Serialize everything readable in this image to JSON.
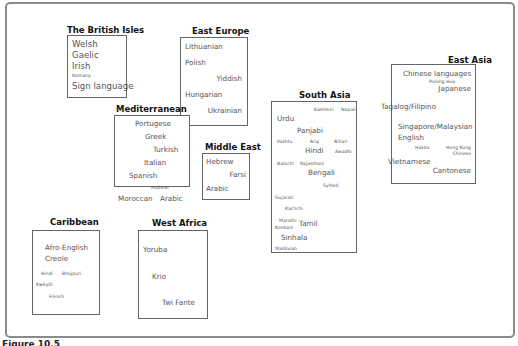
{
  "figure": {
    "caption_label": "Figure 10.5",
    "caption_text": "Community languages in ..."
  },
  "groups": {
    "british_isles": {
      "title": "The British Isles",
      "languages": [
        "Welsh",
        "Gaelic",
        "Irish",
        "Romany",
        "Sign language"
      ]
    },
    "east_europe": {
      "title": "East Europe",
      "languages": [
        "Lithuanian",
        "Polish",
        "Yiddish",
        "Hungarian",
        "Ukrainian"
      ]
    },
    "mediterranean": {
      "title": "Mediterranean",
      "languages": [
        "Portugese",
        "Greek",
        "Turkish",
        "Italian",
        "Spanish",
        "Maltese",
        "Moroccan",
        "Arabic"
      ]
    },
    "middle_east": {
      "title": "Middle East",
      "languages": [
        "Hebrew",
        "Farsi",
        "Arabic"
      ]
    },
    "south_asia": {
      "title": "South Asia",
      "languages": [
        "Kashmiri",
        "Nepali",
        "Urdu",
        "Panjabi",
        "Pashtu",
        "Braj",
        "Bihari",
        "Hindi",
        "Awadhi",
        "Baluchi",
        "Rajasthani",
        "Bengali",
        "Sylheti",
        "Gujarati",
        "Kachchi",
        "Marathi",
        "Konkani",
        "Tamil",
        "Sinhala",
        "Maldivian"
      ]
    },
    "east_asia": {
      "title": "East Asia",
      "languages": [
        "Chinese languages",
        "Pulong Hua",
        "Japanese",
        "Tagalog/Filipino",
        "Singapore/Malaysian",
        "English",
        "Hakka",
        "Hong Kong",
        "Chinese",
        "Vietnamese",
        "Cantonese"
      ]
    },
    "caribbean": {
      "title": "Caribbean",
      "languages": [
        "Afro-English",
        "Creole",
        "Hindi",
        "Bhojpuri",
        "Kwéyòl",
        "French"
      ]
    },
    "west_africa": {
      "title": "West Africa",
      "languages": [
        "Yoruba",
        "Krio",
        "Twi Fante"
      ]
    }
  }
}
